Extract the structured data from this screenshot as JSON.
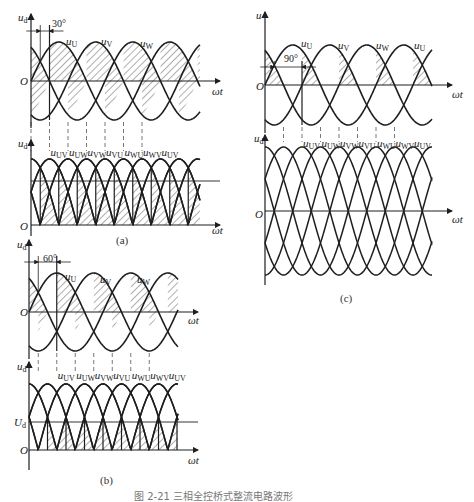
{
  "figure_caption": "图 2-21  三相全控桥式整流电路波形",
  "panels": [
    {
      "id": "a",
      "caption": "(a)",
      "angle_label": "30°",
      "firing_angle_deg": 30,
      "top": {
        "y_label": "u",
        "y_sub": "d",
        "x_label": "ωt",
        "origin": "O",
        "phase_labels": [
          {
            "t": "u",
            "s": "U"
          },
          {
            "t": "u",
            "s": "V"
          },
          {
            "t": "u",
            "s": "W"
          }
        ]
      },
      "bottom": {
        "y_label": "u",
        "y_sub": "d",
        "x_label": "ωt",
        "origin": "O",
        "line_labels": [
          "UV",
          "UW",
          "VW",
          "VU",
          "WU",
          "WV",
          "UV"
        ]
      }
    },
    {
      "id": "b",
      "caption": "(b)",
      "angle_label": "60°",
      "firing_angle_deg": 60,
      "top": {
        "y_label": "u",
        "y_sub": "d",
        "x_label": "ωt",
        "origin": "O",
        "phase_labels": [
          {
            "t": "u",
            "s": "U"
          },
          {
            "t": "u",
            "s": "V"
          },
          {
            "t": "u",
            "s": "W"
          }
        ]
      },
      "bottom": {
        "y_label": "u",
        "y_sub": "d",
        "x_label": "ωt",
        "origin": "O",
        "mean_label": "U",
        "mean_sub": "d",
        "line_labels": [
          "UV",
          "UW",
          "VW",
          "VU",
          "WU",
          "WV",
          "UV"
        ]
      }
    },
    {
      "id": "c",
      "caption": "(c)",
      "angle_label": "90°",
      "firing_angle_deg": 90,
      "top": {
        "y_label": "u",
        "y_sub": "",
        "x_label": "ωt",
        "origin": "O",
        "phase_labels": [
          {
            "t": "u",
            "s": "U"
          },
          {
            "t": "u",
            "s": "V"
          },
          {
            "t": "u",
            "s": "W"
          },
          {
            "t": "u",
            "s": "U"
          }
        ]
      },
      "bottom": {
        "y_label": "u",
        "y_sub": "d",
        "x_label": "ωt",
        "origin": "O",
        "line_labels": [
          "UV",
          "UW",
          "VW",
          "VU",
          "WU",
          "WV",
          "UV"
        ]
      }
    }
  ],
  "colors": {
    "ink": "#1e1e1e",
    "hatch": "#333333",
    "dash": "#555555",
    "background": "#ffffff"
  }
}
